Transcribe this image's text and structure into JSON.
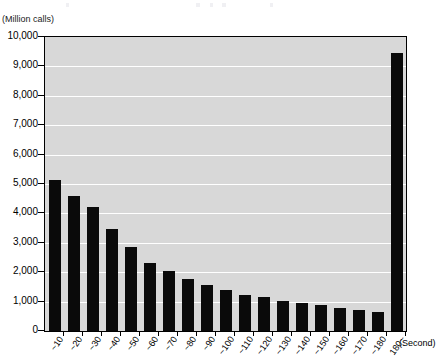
{
  "chart_data": {
    "type": "bar",
    "title": "",
    "subtitle": "",
    "ylabel": "(Million calls)",
    "xlabel": "(Second)",
    "ylim": [
      0,
      10000
    ],
    "ystep": 1000,
    "grid": true,
    "legend": null,
    "categories": [
      "~10",
      "~20",
      "~30",
      "~40",
      "~50",
      "~60",
      "~70",
      "~80",
      "~90",
      "~100",
      "~110",
      "~120",
      "~130",
      "~140",
      "~150",
      "~160",
      "~170",
      "~180",
      "180~"
    ],
    "values": [
      5130,
      4580,
      4220,
      3480,
      2860,
      2330,
      2030,
      1780,
      1560,
      1380,
      1230,
      1150,
      1020,
      950,
      880,
      790,
      700,
      650,
      9470
    ],
    "ytick_labels": [
      "10,000",
      "9,000",
      "8,000",
      "7,000",
      "6,000",
      "5,000",
      "4,000",
      "3,000",
      "2,000",
      "1,000",
      "0"
    ],
    "ytick_values": [
      10000,
      9000,
      8000,
      7000,
      6000,
      5000,
      4000,
      3000,
      2000,
      1000,
      0
    ],
    "bar_color": "#0a0a0a",
    "plot_background": "#d8d8d8",
    "gridline_color": "#ffffff",
    "axis_color": "#000000"
  }
}
